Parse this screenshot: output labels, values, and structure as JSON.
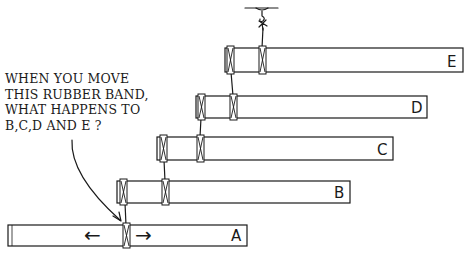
{
  "question": {
    "lines": [
      "WHEN YOU MOVE",
      "THIS RUBBER BAND,",
      "WHAT HAPPENS TO",
      "B,C,D AND E ?"
    ]
  },
  "sticks": [
    {
      "id": "A",
      "label": "A"
    },
    {
      "id": "B",
      "label": "B"
    },
    {
      "id": "C",
      "label": "C"
    },
    {
      "id": "D",
      "label": "D"
    },
    {
      "id": "E",
      "label": "E"
    }
  ],
  "arrows": {
    "left": "←",
    "right": "→"
  },
  "colors": {
    "ink": "#1a1a1a",
    "paper": "#ffffff"
  }
}
